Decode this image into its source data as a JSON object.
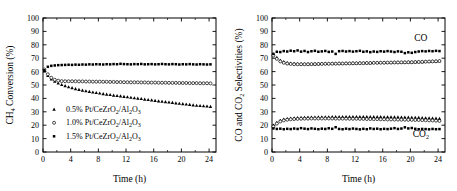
{
  "figure": {
    "panels": [
      "left",
      "right"
    ]
  },
  "chart_data": [
    {
      "panel": "left",
      "type": "scatter",
      "title": "",
      "xlabel": "Time (h)",
      "ylabel": "CH4 Conversion (%)",
      "ylabel_parts": {
        "pre": "CH",
        "sub": "4",
        "post": " Conversion (%)"
      },
      "xlim": [
        0,
        25
      ],
      "ylim": [
        0,
        100
      ],
      "xticks": [
        0,
        4,
        8,
        12,
        16,
        20,
        24
      ],
      "yticks": [
        0,
        10,
        20,
        30,
        40,
        50,
        60,
        70,
        80,
        90,
        100
      ],
      "grid": false,
      "legend_position": "lower-left",
      "series": [
        {
          "name": "0.5% Pt/CeZrO2/Al2O3",
          "marker": "filled-triangle",
          "color": "#000000",
          "x": [
            0.2,
            0.7,
            1.2,
            1.7,
            2.2,
            2.7,
            3.2,
            3.7,
            4.2,
            4.7,
            5.2,
            5.7,
            6.2,
            6.7,
            7.2,
            7.7,
            8.2,
            8.7,
            9.2,
            9.7,
            10.2,
            10.7,
            11.2,
            11.7,
            12.2,
            12.7,
            13.2,
            13.7,
            14.2,
            14.7,
            15.2,
            15.7,
            16.2,
            16.7,
            17.2,
            17.7,
            18.2,
            18.7,
            19.2,
            19.7,
            20.2,
            20.7,
            21.2,
            21.7,
            22.2,
            22.7,
            23.2,
            23.7,
            24.2
          ],
          "y": [
            60.5,
            57.0,
            54.5,
            52.8,
            51.4,
            50.3,
            49.4,
            48.6,
            47.9,
            47.2,
            46.6,
            46.1,
            45.6,
            45.1,
            44.7,
            44.3,
            43.9,
            43.5,
            43.1,
            42.8,
            42.4,
            42.1,
            41.8,
            41.4,
            41.1,
            40.8,
            40.4,
            40.1,
            39.8,
            39.4,
            39.1,
            38.8,
            38.4,
            38.1,
            37.8,
            37.5,
            37.2,
            36.9,
            36.6,
            36.3,
            36.0,
            35.7,
            35.4,
            35.1,
            34.8,
            34.6,
            34.4,
            34.2,
            34.0
          ]
        },
        {
          "name": "1.0% Pt/CeZrO2/Al2O3",
          "marker": "open-circle",
          "color": "#000000",
          "x": [
            0.2,
            0.7,
            1.2,
            1.7,
            2.2,
            2.7,
            3.2,
            3.7,
            4.2,
            4.7,
            5.2,
            5.7,
            6.2,
            6.7,
            7.2,
            7.7,
            8.2,
            8.7,
            9.2,
            9.7,
            10.2,
            10.7,
            11.2,
            11.7,
            12.2,
            12.7,
            13.2,
            13.7,
            14.2,
            14.7,
            15.2,
            15.7,
            16.2,
            16.7,
            17.2,
            17.7,
            18.2,
            18.7,
            19.2,
            19.7,
            20.2,
            20.7,
            21.2,
            21.7,
            22.2,
            22.7,
            23.2,
            23.7,
            24.2
          ],
          "y": [
            61.5,
            58.0,
            55.4,
            53.9,
            53.2,
            52.9,
            52.8,
            52.8,
            52.8,
            52.8,
            52.7,
            52.7,
            52.6,
            52.6,
            52.5,
            52.5,
            52.5,
            52.4,
            52.4,
            52.3,
            52.3,
            52.2,
            52.2,
            52.1,
            52.1,
            52.0,
            52.0,
            52.0,
            51.9,
            51.9,
            51.8,
            51.8,
            51.8,
            51.7,
            51.7,
            51.7,
            51.6,
            51.6,
            51.6,
            51.5,
            51.5,
            51.5,
            51.4,
            51.4,
            51.4,
            51.3,
            51.3,
            51.3,
            51.2
          ]
        },
        {
          "name": "1.5% Pt/CeZrO2/Al2O3",
          "marker": "filled-square",
          "color": "#000000",
          "x": [
            0.2,
            0.7,
            1.2,
            1.7,
            2.2,
            2.7,
            3.2,
            3.7,
            4.2,
            4.7,
            5.2,
            5.7,
            6.2,
            6.7,
            7.2,
            7.7,
            8.2,
            8.7,
            9.2,
            9.7,
            10.2,
            10.7,
            11.2,
            11.7,
            12.2,
            12.7,
            13.2,
            13.7,
            14.2,
            14.7,
            15.2,
            15.7,
            16.2,
            16.7,
            17.2,
            17.7,
            18.2,
            18.7,
            19.2,
            19.7,
            20.2,
            20.7,
            21.2,
            21.7,
            22.2,
            22.7,
            23.2,
            23.7,
            24.2
          ],
          "y": [
            61.0,
            63.6,
            64.3,
            64.6,
            64.8,
            64.9,
            65.0,
            65.1,
            65.0,
            65.2,
            65.1,
            65.3,
            65.2,
            65.4,
            65.3,
            65.5,
            65.4,
            65.3,
            65.5,
            65.4,
            65.6,
            65.5,
            65.8,
            65.6,
            65.5,
            65.4,
            65.6,
            65.5,
            65.7,
            65.4,
            65.5,
            65.6,
            65.4,
            65.5,
            65.7,
            65.5,
            65.4,
            65.6,
            65.5,
            65.3,
            65.5,
            65.4,
            65.6,
            65.4,
            65.3,
            65.5,
            65.4,
            65.3,
            65.4
          ]
        }
      ]
    },
    {
      "panel": "right",
      "type": "scatter",
      "title": "",
      "xlabel": "Time (h)",
      "ylabel": "CO and CO2 Selectivities (%)",
      "ylabel_parts": {
        "pre": "CO and CO",
        "sub": "2",
        "post": " Selectivities (%)"
      },
      "xlim": [
        0,
        25
      ],
      "ylim": [
        0,
        100
      ],
      "xticks": [
        0,
        4,
        8,
        12,
        16,
        20,
        24
      ],
      "yticks": [
        0,
        10,
        20,
        30,
        40,
        50,
        60,
        70,
        80,
        90,
        100
      ],
      "grid": false,
      "legend_position": "none",
      "annotations": [
        {
          "text": "CO",
          "x": 21.5,
          "y": 83
        },
        {
          "text": "CO2",
          "text_pre": "CO",
          "text_sub": "2",
          "x": 21.5,
          "y": 11
        }
      ],
      "series": [
        {
          "name": "CO - 0.5% Pt/CeZrO2/Al2O3",
          "group": "CO",
          "marker": "filled-triangle",
          "color": "#000000",
          "x": [
            0.2,
            0.7,
            1.2,
            1.7,
            2.2,
            2.7,
            3.2,
            3.7,
            4.2,
            4.7,
            5.2,
            5.7,
            6.2,
            6.7,
            7.2,
            7.7,
            8.2,
            8.7,
            9.2,
            9.7,
            10.2,
            10.7,
            11.2,
            11.7,
            12.2,
            12.7,
            13.2,
            13.7,
            14.2,
            14.7,
            15.2,
            15.7,
            16.2,
            16.7,
            17.2,
            17.7,
            18.2,
            18.7,
            19.2,
            19.7,
            20.2,
            20.7,
            21.2,
            21.7,
            22.2,
            22.7,
            23.2,
            23.7,
            24.2
          ],
          "y": [
            73.0,
            70.5,
            68.4,
            67.3,
            66.6,
            66.2,
            66.0,
            65.9,
            65.8,
            65.8,
            65.8,
            65.8,
            65.9,
            65.9,
            66.0,
            66.0,
            66.0,
            66.1,
            66.1,
            66.2,
            66.2,
            66.3,
            66.3,
            66.4,
            66.4,
            66.5,
            66.5,
            66.6,
            66.6,
            66.7,
            66.7,
            66.8,
            66.8,
            66.9,
            66.9,
            67.0,
            67.0,
            67.1,
            67.1,
            67.2,
            67.2,
            67.3,
            67.4,
            67.4,
            67.5,
            67.6,
            67.7,
            67.8,
            68.0
          ]
        },
        {
          "name": "CO - 1.0% Pt/CeZrO2/Al2O3",
          "group": "CO",
          "marker": "open-circle",
          "color": "#000000",
          "x": [
            0.2,
            0.7,
            1.2,
            1.7,
            2.2,
            2.7,
            3.2,
            3.7,
            4.2,
            4.7,
            5.2,
            5.7,
            6.2,
            6.7,
            7.2,
            7.7,
            8.2,
            8.7,
            9.2,
            9.7,
            10.2,
            10.7,
            11.2,
            11.7,
            12.2,
            12.7,
            13.2,
            13.7,
            14.2,
            14.7,
            15.2,
            15.7,
            16.2,
            16.7,
            17.2,
            17.7,
            18.2,
            18.7,
            19.2,
            19.7,
            20.2,
            20.7,
            21.2,
            21.7,
            22.2,
            22.7,
            23.2,
            23.7,
            24.2
          ],
          "y": [
            72.0,
            69.5,
            67.6,
            66.6,
            66.0,
            65.7,
            65.5,
            65.5,
            65.5,
            65.5,
            65.5,
            65.6,
            65.6,
            65.7,
            65.7,
            65.8,
            65.8,
            65.9,
            65.9,
            66.0,
            66.0,
            66.1,
            66.1,
            66.2,
            66.2,
            66.3,
            66.3,
            66.4,
            66.4,
            66.5,
            66.5,
            66.6,
            66.6,
            66.7,
            66.7,
            66.8,
            66.8,
            66.9,
            66.9,
            67.0,
            67.0,
            67.1,
            67.2,
            67.3,
            67.4,
            67.5,
            67.6,
            67.7,
            67.9
          ]
        },
        {
          "name": "CO - 1.5% Pt/CeZrO2/Al2O3",
          "group": "CO",
          "marker": "filled-square",
          "color": "#000000",
          "x": [
            0.2,
            0.7,
            1.2,
            1.7,
            2.2,
            2.7,
            3.2,
            3.7,
            4.2,
            4.7,
            5.2,
            5.7,
            6.2,
            6.7,
            7.2,
            7.7,
            8.2,
            8.7,
            9.2,
            9.7,
            10.2,
            10.7,
            11.2,
            11.7,
            12.2,
            12.7,
            13.2,
            13.7,
            14.2,
            14.7,
            15.2,
            15.7,
            16.2,
            16.7,
            17.2,
            17.7,
            18.2,
            18.7,
            19.2,
            19.7,
            20.2,
            20.7,
            21.2,
            21.7,
            22.2,
            22.7,
            23.2,
            23.7,
            24.2
          ],
          "y": [
            73.2,
            74.8,
            74.6,
            75.3,
            75.0,
            75.6,
            75.2,
            75.8,
            74.9,
            75.4,
            74.6,
            75.2,
            75.5,
            74.8,
            75.1,
            75.4,
            74.7,
            75.0,
            73.2,
            75.2,
            75.4,
            75.0,
            75.3,
            74.9,
            75.2,
            75.5,
            74.8,
            75.1,
            74.5,
            75.0,
            74.7,
            75.2,
            74.9,
            75.3,
            75.0,
            74.6,
            75.1,
            74.8,
            73.8,
            74.4,
            74.0,
            74.6,
            75.0,
            75.3,
            75.1,
            75.4,
            75.2,
            75.5,
            75.3
          ]
        },
        {
          "name": "CO2 - 0.5% Pt/CeZrO2/Al2O3",
          "group": "CO2",
          "marker": "filled-triangle",
          "color": "#000000",
          "x": [
            0.2,
            0.7,
            1.2,
            1.7,
            2.2,
            2.7,
            3.2,
            3.7,
            4.2,
            4.7,
            5.2,
            5.7,
            6.2,
            6.7,
            7.2,
            7.7,
            8.2,
            8.7,
            9.2,
            9.7,
            10.2,
            10.7,
            11.2,
            11.7,
            12.2,
            12.7,
            13.2,
            13.7,
            14.2,
            14.7,
            15.2,
            15.7,
            16.2,
            16.7,
            17.2,
            17.7,
            18.2,
            18.7,
            19.2,
            19.7,
            20.2,
            20.7,
            21.2,
            21.7,
            22.2,
            22.7,
            23.2,
            23.7,
            24.2
          ],
          "y": [
            20.0,
            22.0,
            23.6,
            24.4,
            24.9,
            25.2,
            25.4,
            25.6,
            25.7,
            25.8,
            25.9,
            26.0,
            26.0,
            26.1,
            26.1,
            26.2,
            26.2,
            26.3,
            26.3,
            26.3,
            26.4,
            26.4,
            26.4,
            26.4,
            26.4,
            26.4,
            26.4,
            26.4,
            26.3,
            26.3,
            26.3,
            26.3,
            26.2,
            26.2,
            26.2,
            26.1,
            26.1,
            26.0,
            26.0,
            25.9,
            25.8,
            25.8,
            25.7,
            25.6,
            25.5,
            25.4,
            25.3,
            25.2,
            25.0
          ]
        },
        {
          "name": "CO2 - 1.0% Pt/CeZrO2/Al2O3",
          "group": "CO2",
          "marker": "open-circle",
          "color": "#000000",
          "x": [
            0.2,
            0.7,
            1.2,
            1.7,
            2.2,
            2.7,
            3.2,
            3.7,
            4.2,
            4.7,
            5.2,
            5.7,
            6.2,
            6.7,
            7.2,
            7.7,
            8.2,
            8.7,
            9.2,
            9.7,
            10.2,
            10.7,
            11.2,
            11.7,
            12.2,
            12.7,
            13.2,
            13.7,
            14.2,
            14.7,
            15.2,
            15.7,
            16.2,
            16.7,
            17.2,
            17.7,
            18.2,
            18.7,
            19.2,
            19.7,
            20.2,
            20.7,
            21.2,
            21.7,
            22.2,
            22.7,
            23.2,
            23.7,
            24.2
          ],
          "y": [
            19.0,
            21.2,
            22.8,
            23.6,
            24.1,
            24.4,
            24.6,
            24.7,
            24.8,
            24.9,
            24.9,
            25.0,
            25.0,
            25.0,
            25.0,
            25.0,
            25.0,
            25.0,
            24.9,
            24.9,
            24.9,
            24.9,
            24.8,
            24.8,
            24.8,
            24.7,
            24.7,
            24.6,
            24.6,
            24.5,
            24.5,
            24.4,
            24.4,
            24.3,
            24.3,
            24.2,
            24.2,
            24.1,
            24.1,
            24.0,
            24.0,
            23.9,
            23.9,
            23.8,
            23.7,
            23.6,
            23.5,
            23.4,
            23.2
          ]
        },
        {
          "name": "CO2 - 1.5% Pt/CeZrO2/Al2O3",
          "group": "CO2",
          "marker": "filled-square",
          "color": "#000000",
          "x": [
            0.2,
            0.7,
            1.2,
            1.7,
            2.2,
            2.7,
            3.2,
            3.7,
            4.2,
            4.7,
            5.2,
            5.7,
            6.2,
            6.7,
            7.2,
            7.7,
            8.2,
            8.7,
            9.2,
            9.7,
            10.2,
            10.7,
            11.2,
            11.7,
            12.2,
            12.7,
            13.2,
            13.7,
            14.2,
            14.7,
            15.2,
            15.7,
            16.2,
            16.7,
            17.2,
            17.7,
            18.2,
            18.7,
            19.2,
            19.7,
            20.2,
            20.7,
            21.2,
            21.7,
            22.2,
            22.7,
            23.2,
            23.7,
            24.2
          ],
          "y": [
            17.6,
            17.2,
            17.4,
            17.0,
            17.3,
            17.1,
            17.5,
            17.2,
            17.8,
            17.4,
            17.1,
            17.6,
            17.3,
            17.0,
            17.4,
            17.2,
            17.7,
            17.3,
            18.5,
            17.2,
            17.0,
            17.4,
            17.1,
            17.5,
            17.2,
            16.9,
            17.3,
            17.0,
            17.6,
            17.2,
            17.4,
            17.0,
            17.3,
            17.1,
            17.4,
            17.8,
            17.2,
            17.5,
            18.4,
            17.6,
            17.9,
            17.3,
            17.0,
            17.2,
            17.1,
            16.9,
            17.2,
            17.0,
            17.1
          ]
        }
      ]
    }
  ],
  "left_panel": {
    "legend": [
      {
        "marker": "filled-triangle",
        "pre": "0.5% Pt/CeZrO",
        "sub1": "2",
        "mid": "/Al",
        "sub2": "2",
        "mid2": "O",
        "sub3": "3"
      },
      {
        "marker": "open-circle",
        "pre": "1.0% Pt/CeZrO",
        "sub1": "2",
        "mid": "/Al",
        "sub2": "2",
        "mid2": "O",
        "sub3": "3"
      },
      {
        "marker": "filled-square",
        "pre": "1.5% Pt/CeZrO",
        "sub1": "2",
        "mid": "/Al",
        "sub2": "2",
        "mid2": "O",
        "sub3": "3"
      }
    ]
  }
}
